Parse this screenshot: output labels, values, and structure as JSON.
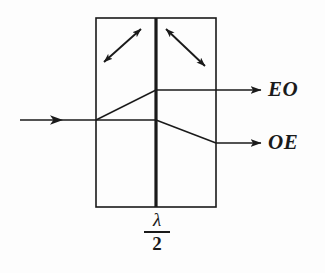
{
  "figure": {
    "background_color": "#fdfdfd",
    "stroke_color": "#1a1a1a"
  },
  "crystal_box": {
    "name": "birefringent-crystal-block",
    "x": 96,
    "y": 18,
    "width": 120,
    "height": 189,
    "stroke_width": 1.6
  },
  "waveplate": {
    "name": "half-wave-plate",
    "x": 156,
    "y_top": 18,
    "y_bottom": 207,
    "stroke_width": 3.2,
    "label_numerator": "λ",
    "label_denominator": "2"
  },
  "optic_axis_arrows": [
    {
      "name": "optic-axis-arrow-left",
      "direction": "up-right",
      "x1": 104,
      "y1": 62,
      "x2": 141,
      "y2": 29
    },
    {
      "name": "optic-axis-arrow-right",
      "direction": "down-right",
      "x1": 166,
      "y1": 29,
      "x2": 205,
      "y2": 66
    }
  ],
  "rays": {
    "input": {
      "name": "input-beam",
      "label": "",
      "x1": 20,
      "y1": 120,
      "x2": 96,
      "y2": 120,
      "arrowhead_x": 62
    },
    "segments": [
      {
        "name": "ray-segment-upper-slanted",
        "from": [
          96,
          120
        ],
        "to": [
          156,
          90
        ]
      },
      {
        "name": "ray-segment-lower-horizontal",
        "from": [
          96,
          120
        ],
        "to": [
          156,
          120
        ]
      },
      {
        "name": "ray-segment-upper-horizontal",
        "from": [
          156,
          90
        ],
        "to": [
          216,
          90
        ]
      },
      {
        "name": "ray-segment-lower-slanted",
        "from": [
          156,
          120
        ],
        "to": [
          216,
          143
        ]
      }
    ],
    "outputs": [
      {
        "name": "output-beam-eo",
        "label": "EO",
        "x1": 216,
        "y1": 90,
        "x2": 262,
        "y2": 90
      },
      {
        "name": "output-beam-oe",
        "label": "OE",
        "x1": 216,
        "y1": 143,
        "x2": 262,
        "y2": 143
      }
    ]
  }
}
